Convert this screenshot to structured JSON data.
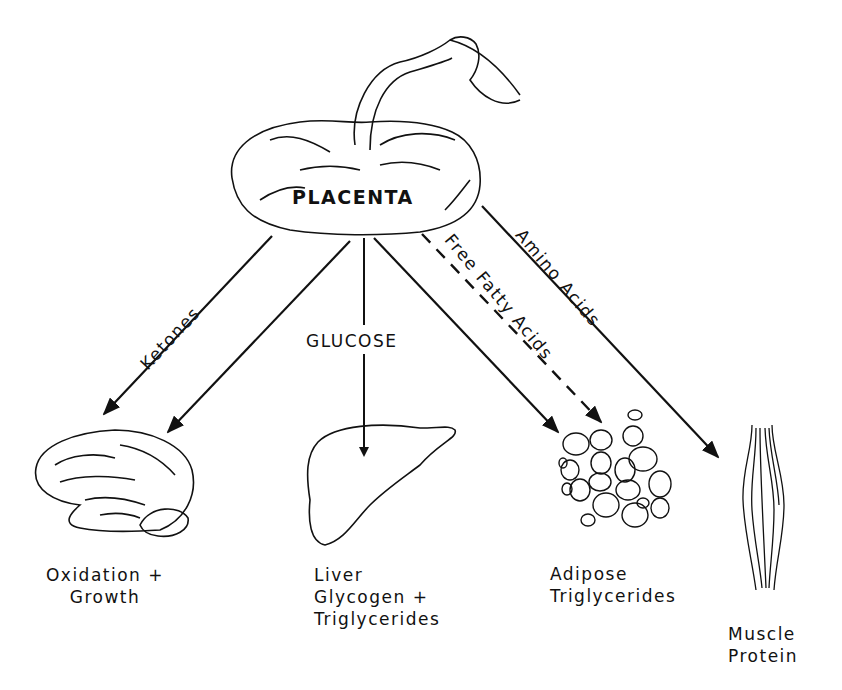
{
  "diagram": {
    "source": {
      "label": "PLACENTA"
    },
    "flows": [
      {
        "id": "ketones",
        "label": "Ketones",
        "style": "solid",
        "to": "brain"
      },
      {
        "id": "glucose-brain",
        "label": "",
        "style": "solid",
        "to": "brain"
      },
      {
        "id": "glucose",
        "label": "GLUCOSE",
        "style": "solid",
        "to": "liver"
      },
      {
        "id": "glucose-adipose",
        "label": "",
        "style": "solid",
        "to": "adipose"
      },
      {
        "id": "ffa",
        "label": "Free Fatty Acids",
        "style": "dashed",
        "to": "adipose"
      },
      {
        "id": "amino",
        "label": "Amino Acids",
        "style": "solid",
        "to": "muscle"
      }
    ],
    "targets": [
      {
        "id": "brain",
        "line1": "Oxidation +",
        "line2": "Growth",
        "line3": ""
      },
      {
        "id": "liver",
        "line1": "Liver",
        "line2": "Glycogen +",
        "line3": "Triglycerides"
      },
      {
        "id": "adipose",
        "line1": "Adipose",
        "line2": "Triglycerides",
        "line3": ""
      },
      {
        "id": "muscle",
        "line1": "Muscle",
        "line2": "Protein",
        "line3": ""
      }
    ]
  }
}
